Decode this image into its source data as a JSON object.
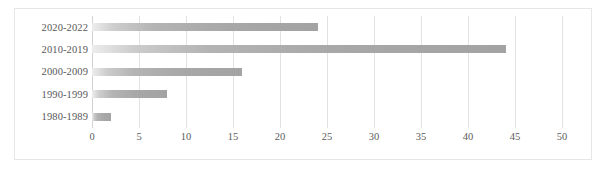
{
  "chart_data": {
    "type": "bar",
    "orientation": "horizontal",
    "title": "",
    "xlabel": "",
    "ylabel": "",
    "categories": [
      "2020-2022",
      "2010-2019",
      "2000-2009",
      "1990-1999",
      "1980-1989"
    ],
    "values": [
      24,
      44,
      16,
      8,
      2
    ],
    "xlim": [
      0,
      50
    ],
    "ylim": null,
    "xticks": [
      0,
      5,
      10,
      15,
      20,
      25,
      30,
      35,
      40,
      45,
      50
    ],
    "xtick_labels": [
      "0",
      "5",
      "10",
      "15",
      "20",
      "25",
      "30",
      "35",
      "40",
      "45",
      "50"
    ],
    "grid": "vertical",
    "legend": null,
    "legend_position": "none",
    "bar_color": "#a3a3a3",
    "gridline_color": "#e2e2e2",
    "axis_line_color": "#d2d2d2",
    "border_color": "#e6e6e6",
    "label_color": "#585858",
    "background_color": "#ffffff"
  }
}
